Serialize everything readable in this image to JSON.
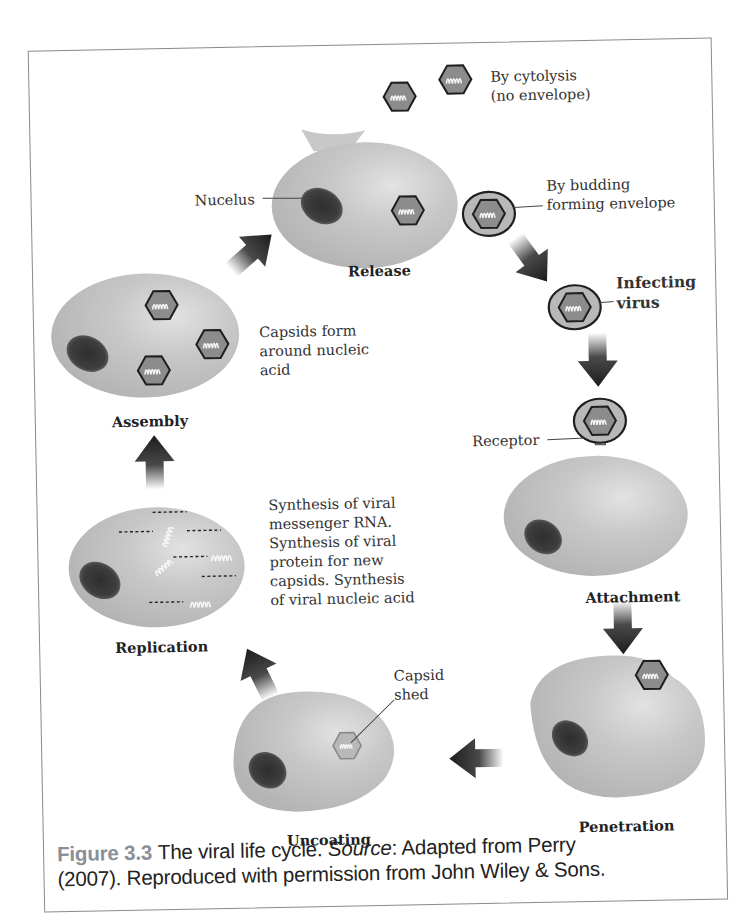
{
  "figure": {
    "title": "The viral life cycle",
    "stages": {
      "release": "Release",
      "attachment": "Attachment",
      "penetration": "Penetration",
      "uncoating": "Uncoating",
      "replication": "Replication",
      "assembly": "Assembly"
    },
    "labels": {
      "nucleus": "Nucelus",
      "cytolysis_line1": "By cytolysis",
      "cytolysis_line2": "(no envelope)",
      "budding_line1": "By budding",
      "budding_line2": "forming envelope",
      "infecting_line1": "Infecting",
      "infecting_line2": "virus",
      "receptor": "Receptor",
      "capsid_shed_line1": "Capsid",
      "capsid_shed_line2": "shed",
      "assembly_note": [
        "Capsids form",
        "around nucleic",
        "acid"
      ],
      "replication_note": [
        "Synthesis of viral",
        "messenger RNA.",
        "Synthesis of viral",
        "protein for new",
        "capsids. Synthesis",
        "of viral nucleic acid"
      ]
    },
    "colors": {
      "cell": "#c4c4c4",
      "nucleus": "#3a3a3a",
      "capsid_fill": "#8c8c8c",
      "capsid_outline": "#1e1e1e",
      "arrow": "#1c1c1c",
      "figure_number": "#8a8f96"
    }
  },
  "caption": {
    "figure_number": "Figure 3.3",
    "text_before_source": "The viral life cycle.",
    "source_label": "Source",
    "text_after_source": ": Adapted from Perry",
    "line2": "(2007). Reproduced with permission from John Wiley & Sons."
  }
}
